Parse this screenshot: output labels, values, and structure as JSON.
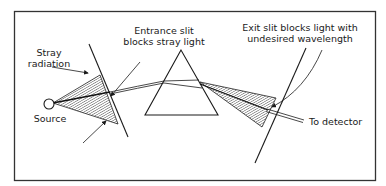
{
  "diagram": {
    "type": "monochromator slit optics",
    "labels": {
      "stray_radiation": [
        "Stray",
        "radiation"
      ],
      "entrance_slit": [
        "Entrance slit",
        "blocks stray light"
      ],
      "exit_slit": [
        "Exit slit blocks light with",
        "undesired wavelength"
      ],
      "source": "Source",
      "to_detector": "To detector"
    },
    "components": [
      "source",
      "entrance-slit",
      "prism",
      "exit-slit",
      "detector-beam"
    ],
    "colors": {
      "line": "#1a1a1a",
      "background": "#ffffff"
    }
  }
}
